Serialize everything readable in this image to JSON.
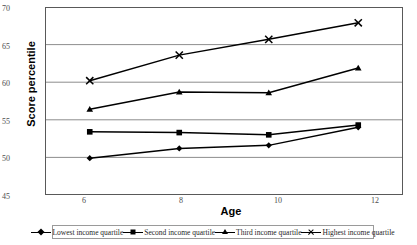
{
  "chart_data": {
    "type": "line",
    "title": "",
    "xlabel": "Age",
    "ylabel": "Score percentile",
    "categories": [
      6,
      8,
      10,
      12
    ],
    "x_tick_labels": [
      "6",
      "8",
      "10",
      "12"
    ],
    "y_tick_labels": [
      "45",
      "50",
      "55",
      "60",
      "65",
      "70"
    ],
    "ylim": [
      45,
      70
    ],
    "y_tick_step": 5,
    "grid": "horizontal",
    "legend_position": "bottom",
    "series": [
      {
        "name": "Lowest income quartile",
        "marker": "diamond",
        "values": [
          49.9,
          51.2,
          51.6,
          54.0
        ]
      },
      {
        "name": "Second income quartile",
        "marker": "square",
        "values": [
          53.4,
          53.3,
          53.0,
          54.3
        ]
      },
      {
        "name": "Third income quartile",
        "marker": "triangle",
        "values": [
          56.4,
          58.7,
          58.6,
          61.9
        ]
      },
      {
        "name": "Highest income quartile",
        "marker": "cross",
        "values": [
          60.2,
          63.6,
          65.7,
          67.9
        ]
      }
    ],
    "colors": {
      "line": "#000000",
      "grid": "#808080",
      "axis": "#595959",
      "text": "#000000",
      "tick_text": "#4d4d4d"
    }
  }
}
